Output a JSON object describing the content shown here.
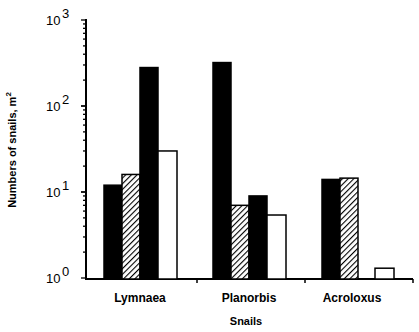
{
  "chart_data": {
    "type": "bar",
    "title": "",
    "xlabel": "Snails",
    "ylabel": "Numbers of snails, m",
    "ylabel_superscript": "2",
    "yscale": "log",
    "ylim": [
      1,
      1000
    ],
    "yticks": [
      {
        "base": "10",
        "exp": "0",
        "value": 1
      },
      {
        "base": "10",
        "exp": "1",
        "value": 10
      },
      {
        "base": "10",
        "exp": "2",
        "value": 100
      },
      {
        "base": "10",
        "exp": "3",
        "value": 1000
      }
    ],
    "categories": [
      "Lymnaea",
      "Planorbis",
      "Acroloxus"
    ],
    "series": [
      {
        "name": "Series 1 (black)",
        "fill": "black",
        "values": [
          12,
          320,
          14
        ]
      },
      {
        "name": "Series 2 (hatched)",
        "fill": "hatched",
        "values": [
          16,
          7,
          14.5
        ]
      },
      {
        "name": "Series 3 (black)",
        "fill": "black",
        "values": [
          280,
          9,
          null
        ]
      },
      {
        "name": "Series 4 (white)",
        "fill": "white",
        "values": [
          30,
          5.4,
          1.3
        ]
      }
    ],
    "legend": "none",
    "grid": false
  }
}
